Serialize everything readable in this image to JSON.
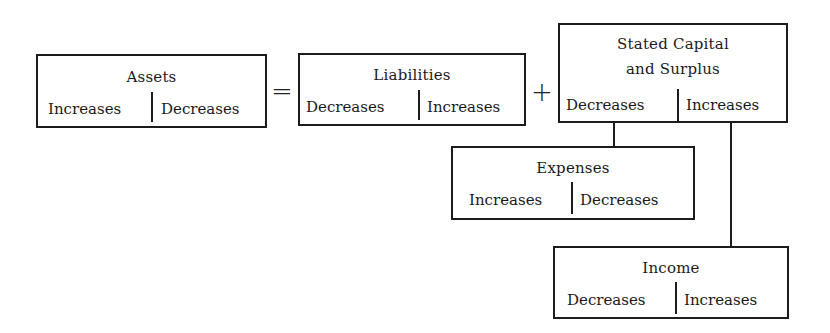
{
  "diagram": {
    "equation": {
      "equals": "=",
      "plus": "+"
    },
    "accounts": {
      "assets": {
        "title": "Assets",
        "left": "Increases",
        "right": "Decreases"
      },
      "liabilities": {
        "title": "Liabilities",
        "left": "Decreases",
        "right": "Increases"
      },
      "capital": {
        "title_line1": "Stated Capital",
        "title_line2": "and Surplus",
        "left": "Decreases",
        "right": "Increases"
      },
      "expenses": {
        "title": "Expenses",
        "left": "Increases",
        "right": "Decreases"
      },
      "income": {
        "title": "Income",
        "left": "Decreases",
        "right": "Increases"
      }
    },
    "connections": [
      {
        "from": "capital.left",
        "to": "expenses"
      },
      {
        "from": "capital.right",
        "to": "income"
      }
    ]
  }
}
